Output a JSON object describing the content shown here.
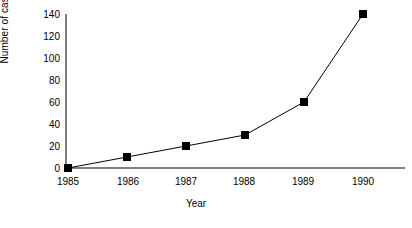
{
  "chart_data": {
    "type": "line",
    "title": "",
    "xlabel": "Year",
    "ylabel": "Number of cases",
    "categories": [
      "1985",
      "1986",
      "1987",
      "1988",
      "1989",
      "1990"
    ],
    "values": [
      0,
      10,
      20,
      30,
      60,
      140
    ],
    "series": [
      {
        "name": "Number of cases",
        "values": [
          0,
          10,
          20,
          30,
          60,
          140
        ]
      }
    ],
    "yticks": [
      0,
      20,
      40,
      60,
      80,
      100,
      120,
      140
    ],
    "ytick_labels": [
      "0",
      "20",
      "40",
      "60",
      "80",
      "100",
      "120",
      "140"
    ],
    "ylim": [
      0,
      140
    ],
    "grid": false,
    "legend": false,
    "legend_position": "none",
    "marker": "filled-square",
    "marker_color": "#000000",
    "line_color": "#000000",
    "background_color": "#ffffff"
  }
}
